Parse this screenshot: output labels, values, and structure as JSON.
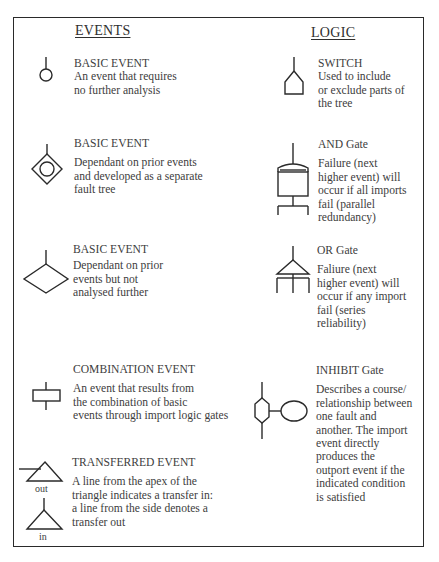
{
  "headings": {
    "events": "EVENTS",
    "logic": "LOGIC"
  },
  "events": [
    {
      "icon": "basic-event-circle-icon",
      "title": "BASIC EVENT",
      "description_lines": [
        "An event that requires",
        "no further analysis"
      ]
    },
    {
      "icon": "diamond-with-circle-icon",
      "title": "BASIC EVENT",
      "description_lines": [
        "Dependant on prior events",
        "and developed as a separate",
        "fault tree"
      ]
    },
    {
      "icon": "diamond-icon",
      "title": "BASIC EVENT",
      "description_lines": [
        "Dependant on prior",
        "events but not",
        "analysed further"
      ]
    },
    {
      "icon": "rectangle-icon",
      "title": "COMBINATION EVENT",
      "description_lines": [
        "An event that results from",
        "the combination of basic",
        "events  through import logic gates"
      ]
    },
    {
      "icon": "transfer-triangle-icon",
      "title": "TRANSFERRED EVENT",
      "description_lines": [
        "A line from the apex of the",
        "triangle indicates a transfer in:",
        "a line from the side denotes a",
        "transfer out"
      ],
      "icon_labels": {
        "out": "out",
        "in": "in"
      }
    }
  ],
  "logic": [
    {
      "icon": "switch-icon",
      "title": "SWITCH",
      "description_lines": [
        "Used to include",
        "or exclude parts of",
        "the tree"
      ]
    },
    {
      "icon": "and-gate-icon",
      "title": "AND Gate",
      "description_lines": [
        "Failure (next",
        "higher event) will",
        "occur if all imports",
        "fail (parallel",
        "redundancy)"
      ]
    },
    {
      "icon": "or-gate-icon",
      "title": "OR Gate",
      "description_lines": [
        "Faliure (next",
        "higher event) will",
        "occur if any import",
        "fail (series",
        "reliability)"
      ]
    },
    {
      "icon": "inhibit-gate-icon",
      "title": "INHIBIT Gate",
      "description_lines": [
        "Describes a course/",
        "relationship between",
        "one fault and",
        "another. The import",
        "event directly",
        "produces the",
        "outport event if the",
        "indicated condition",
        "is satisfied"
      ]
    }
  ]
}
